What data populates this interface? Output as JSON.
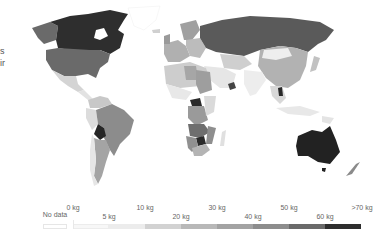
{
  "left_cutoff_text": [
    "s",
    "ir"
  ],
  "map": {
    "type": "choropleth",
    "projection": "robinson-like",
    "fill_scale": [
      "#ffffff",
      "#f2f2f2",
      "#dcdcdc",
      "#c4c4c4",
      "#adadad",
      "#959595",
      "#6e6e6e",
      "#3a3a3a"
    ],
    "regions": [
      {
        "name": "Canada",
        "bin": ">70 kg",
        "shade": "#2e2e2e"
      },
      {
        "name": "United States",
        "bin": "50-60 kg",
        "shade": "#6a6a6a"
      },
      {
        "name": "Mexico",
        "bin": "10-20 kg",
        "shade": "#d4d4d4"
      },
      {
        "name": "Greenland",
        "bin": "No data",
        "shade": "#ffffff"
      },
      {
        "name": "Russia",
        "bin": "60-70 kg",
        "shade": "#5a5a5a"
      },
      {
        "name": "China",
        "bin": "30-40 kg",
        "shade": "#b2b2b2"
      },
      {
        "name": "Europe",
        "bin": "20-40 kg",
        "shade": "#a8a8a8"
      },
      {
        "name": "India",
        "bin": "5-10 kg",
        "shade": "#ededed"
      },
      {
        "name": "Brazil",
        "bin": "40-50 kg",
        "shade": "#8c8c8c"
      },
      {
        "name": "Bolivia",
        "bin": ">70 kg",
        "shade": "#262626"
      },
      {
        "name": "Argentina",
        "bin": "30-40 kg",
        "shade": "#a4a4a4"
      },
      {
        "name": "Central African Republic",
        "bin": ">70 kg",
        "shade": "#2a2a2a"
      },
      {
        "name": "Botswana",
        "bin": ">70 kg",
        "shade": "#2a2a2a"
      },
      {
        "name": "Oman",
        "bin": "60-70 kg",
        "shade": "#444444"
      },
      {
        "name": "Laos",
        "bin": ">70 kg",
        "shade": "#2a2a2a"
      },
      {
        "name": "Australia",
        "bin": ">70 kg",
        "shade": "#222222"
      },
      {
        "name": "New Zealand",
        "bin": "40-50 kg",
        "shade": "#8a8a8a"
      }
    ]
  },
  "legend": {
    "no_data_label": "No data",
    "top_labels": [
      "0 kg",
      "10 kg",
      "30 kg",
      "50 kg",
      ">70 kg"
    ],
    "bottom_labels": [
      "5 kg",
      "20 kg",
      "40 kg",
      "60 kg"
    ],
    "bins": [
      {
        "range": "0-5 kg",
        "color": "#f7f7f7"
      },
      {
        "range": "5-10 kg",
        "color": "#ececec"
      },
      {
        "range": "10-20 kg",
        "color": "#d2d2d2"
      },
      {
        "range": "20-30 kg",
        "color": "#b8b8b8"
      },
      {
        "range": "30-40 kg",
        "color": "#a3a3a3"
      },
      {
        "range": "40-50 kg",
        "color": "#8d8d8d"
      },
      {
        "range": "50-60 kg",
        "color": "#6a6a6a"
      },
      {
        "range": "60-70 kg",
        "color": "#2e2e2e"
      }
    ]
  }
}
